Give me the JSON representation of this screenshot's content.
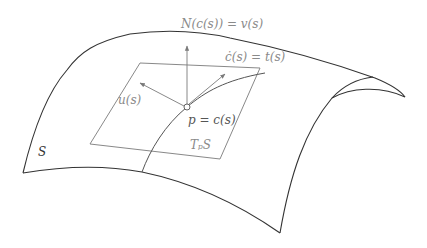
{
  "diagram": {
    "labels": {
      "normal": "N(c(s)) = v(s)",
      "tangent": "ċ(s) = t(s)",
      "conormal": "u(s)",
      "point": "p = c(s)",
      "tangent_plane": "TₚS",
      "surface": "S"
    },
    "colors": {
      "surface_stroke": "#333333",
      "frame_stroke": "#7a7a7a",
      "label_color": "#8a8a8a",
      "background": "#ffffff"
    },
    "nodes": [
      {
        "id": "surface",
        "label": "S"
      },
      {
        "id": "tangent-plane",
        "label": "TₚS"
      },
      {
        "id": "point",
        "label": "p = c(s)"
      },
      {
        "id": "curve",
        "label": "c(s)"
      },
      {
        "id": "normal-vector",
        "label": "N(c(s)) = v(s)"
      },
      {
        "id": "tangent-vector",
        "label": "ċ(s) = t(s)"
      },
      {
        "id": "conormal-vector",
        "label": "u(s)"
      }
    ],
    "edges": [
      {
        "from": "point",
        "to": "normal-vector",
        "type": "arrow"
      },
      {
        "from": "point",
        "to": "tangent-vector",
        "type": "arrow"
      },
      {
        "from": "point",
        "to": "conormal-vector",
        "type": "arrow"
      }
    ]
  }
}
